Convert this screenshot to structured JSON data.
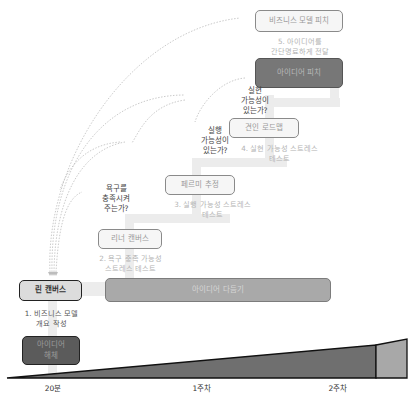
{
  "stages": [
    {
      "id": "idea-dump",
      "label": "아이디어\n해체",
      "step": ""
    },
    {
      "id": "lean-canvas",
      "label": "린 캔버스",
      "step": "1. 비즈니스 모델\n개요 작성"
    },
    {
      "id": "leaner-canvas",
      "label": "리너 캔버스",
      "step": "2. 욕구 충족 가능성\n스트레스 테스트"
    },
    {
      "id": "fermi-estimate",
      "label": "페르미 추정",
      "step": "3. 실행 가능성 스트레스\n테스트"
    },
    {
      "id": "traction-roadmap",
      "label": "견인 로드맵",
      "step": "4. 실현 가능성 스트레스\n테스트"
    },
    {
      "id": "business-model-pitch",
      "label": "비즈니스 모델 피치",
      "step": "5. 아이디어를\n간단명료하게 전달"
    },
    {
      "id": "idea-pitch",
      "label": "아이디어 피치",
      "step": ""
    },
    {
      "id": "idea-refine",
      "label": "아이디어 다듬기",
      "step": ""
    }
  ],
  "questions": {
    "desirability": "욕구를\n충족시켜\n주는가?",
    "viability": "실행\n가능성이\n있는가?",
    "feasibility": "실현\n가능성이\n있는가?"
  },
  "timeline": {
    "ticks": [
      "20분",
      "1주차",
      "2주차"
    ]
  },
  "colors": {
    "dark_box": "#777777",
    "mid_box": "#a9a9a9",
    "light_box": "#f6f6f6",
    "start_box": "#dcdcdc",
    "wedge_dark": "#6f6f6f",
    "wedge_light": "#a8a8a8",
    "connector": "#ececec"
  }
}
